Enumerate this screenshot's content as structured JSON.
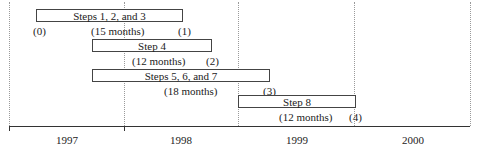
{
  "diagram": {
    "type": "timeline-gantt",
    "years": [
      "1997",
      "1998",
      "1999",
      "2000"
    ],
    "tasks": [
      {
        "label": "Steps 1, 2, and 3",
        "duration": "(15 months)",
        "start_marker": "(0)",
        "end_marker": "(1)"
      },
      {
        "label": "Step 4",
        "duration": "(12 months)",
        "end_marker": "(2)"
      },
      {
        "label": "Steps 5, 6, and 7",
        "duration": "(18 months)",
        "end_marker": "(3)"
      },
      {
        "label": "Step 8",
        "duration": "(12 months)",
        "end_marker": "(4)"
      }
    ]
  }
}
